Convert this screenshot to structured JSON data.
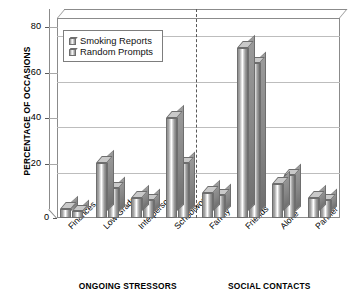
{
  "chart_data": {
    "type": "bar",
    "title": "",
    "xlabel": "",
    "ylabel": "PERCENTAGE OF OCCASIONS",
    "ylim": [
      0,
      88
    ],
    "yticks": [
      0,
      20,
      40,
      60,
      80
    ],
    "ytick_labels": [
      "0",
      "20",
      "40",
      "60",
      "80"
    ],
    "grid": true,
    "legend_position": "upper-left",
    "categories": [
      "Finances",
      "Low Grade",
      "Interpersonal",
      "Schoolwork",
      "Family",
      "Friends",
      "Alone",
      "Partner"
    ],
    "series": [
      {
        "name": "Smoking Reports",
        "values": [
          4,
          24,
          9,
          44,
          11,
          75,
          15,
          9
        ]
      },
      {
        "name": "Random Prompts",
        "values": [
          3,
          13,
          8,
          24,
          10,
          68,
          19,
          8
        ]
      }
    ],
    "groups": [
      {
        "label": "ONGOING STRESSORS",
        "categories": [
          "Finances",
          "Low Grade",
          "Interpersonal",
          "Schoolwork"
        ]
      },
      {
        "label": "SOCIAL CONTACTS",
        "categories": [
          "Family",
          "Friends",
          "Alone",
          "Partner"
        ]
      }
    ],
    "annotations": [
      "dashed vertical divider between ONGOING STRESSORS and SOCIAL CONTACTS"
    ],
    "colors": {
      "bar_light": "#ffffff",
      "bar_mid": "#a5a5a5",
      "bar_dark": "#7e7e7e",
      "bar_top": "#c9c9c9",
      "outline": "#6e6e6e",
      "gridline": "#bdbdbd",
      "axis": "#8b8b8b",
      "divider": "#585858",
      "text": "#000000"
    }
  }
}
